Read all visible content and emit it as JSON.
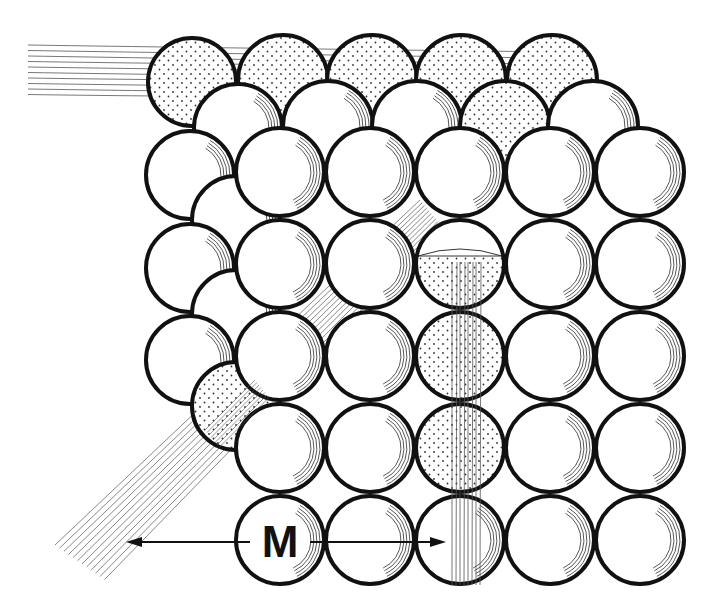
{
  "figure": {
    "label": "M",
    "colors": {
      "outline": "#111111",
      "fill": "#ffffff",
      "stipple": "#333333",
      "ray": "#555555",
      "background": "#ffffff"
    },
    "layers": {
      "back": {
        "name": "top back row",
        "atoms": [
          {
            "cx": 192,
            "cy": 82,
            "r": 44,
            "stippled": true
          },
          {
            "cx": 283,
            "cy": 80,
            "r": 45,
            "stippled": true
          },
          {
            "cx": 372,
            "cy": 80,
            "r": 45,
            "stippled": true
          },
          {
            "cx": 461,
            "cy": 80,
            "r": 45,
            "stippled": true
          },
          {
            "cx": 552,
            "cy": 80,
            "r": 45,
            "stippled": true
          }
        ]
      },
      "middle": {
        "name": "middle layer",
        "atoms": [
          {
            "cx": 238,
            "cy": 128,
            "r": 44
          },
          {
            "cx": 328,
            "cy": 126,
            "r": 45
          },
          {
            "cx": 417,
            "cy": 126,
            "r": 45
          },
          {
            "cx": 505,
            "cy": 126,
            "r": 45,
            "stippled": true
          },
          {
            "cx": 593,
            "cy": 126,
            "r": 45
          },
          {
            "cx": 190,
            "cy": 175,
            "r": 44
          },
          {
            "cx": 236,
            "cy": 220,
            "r": 44
          },
          {
            "cx": 190,
            "cy": 268,
            "r": 44
          },
          {
            "cx": 236,
            "cy": 314,
            "r": 44
          },
          {
            "cx": 190,
            "cy": 360,
            "r": 44
          },
          {
            "cx": 236,
            "cy": 406,
            "r": 44,
            "stippled": true
          }
        ]
      },
      "front": {
        "name": "front grid 5x5",
        "rows": 5,
        "cols": 5,
        "origin": {
          "cx": 280,
          "cy": 172
        },
        "spacing": {
          "dx": 90,
          "dy": 92
        },
        "r": 44,
        "stippled_cells": [
          [
            1,
            2
          ],
          [
            2,
            2
          ],
          [
            3,
            2
          ]
        ],
        "half_stippled_cells": [
          [
            1,
            2
          ]
        ]
      }
    },
    "rays": [
      {
        "name": "incident-ray-left",
        "direction": "horizontal",
        "from": [
          28,
          70
        ],
        "to": [
          300,
          90
        ],
        "count": 10
      },
      {
        "name": "diffracted-ray-lower-left",
        "direction": "diagonal",
        "from": [
          230,
          420
        ],
        "to": [
          70,
          560
        ],
        "count": 12
      },
      {
        "name": "transmitted-ray-bottom",
        "direction": "vertical",
        "from": [
          465,
          260
        ],
        "to": [
          465,
          585
        ],
        "count": 8
      }
    ],
    "dimension_arrow": {
      "label": "M",
      "x1": 126,
      "x2": 446,
      "y": 542
    }
  }
}
